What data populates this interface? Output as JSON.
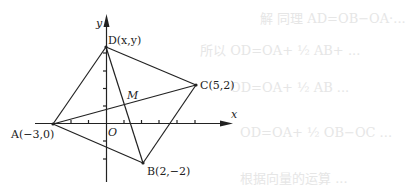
{
  "figure": {
    "axes": {
      "x_label": "x",
      "y_label": "y",
      "origin_label": "O"
    },
    "points": {
      "A": {
        "label": "A(−3,0)",
        "x": -3,
        "y": 0
      },
      "B": {
        "label": "B(2,−2)",
        "x": 2,
        "y": -2
      },
      "C": {
        "label": "C(5,2)",
        "x": 5,
        "y": 2
      },
      "D": {
        "label": "D(x,y)"
      },
      "M": {
        "label": "M"
      }
    },
    "segments": [
      "AD",
      "DC",
      "CB",
      "BA",
      "AC",
      "DB"
    ]
  },
  "bleed_text": [
    "解  同理  AD=OB−OA·...",
    "所以  OD=OA+ ½ AB+ ...",
    "OD=OA+ ½ AB ...",
    "OD=OA+ ½ OB−OC ...",
    "根据向量的运算 ..."
  ]
}
